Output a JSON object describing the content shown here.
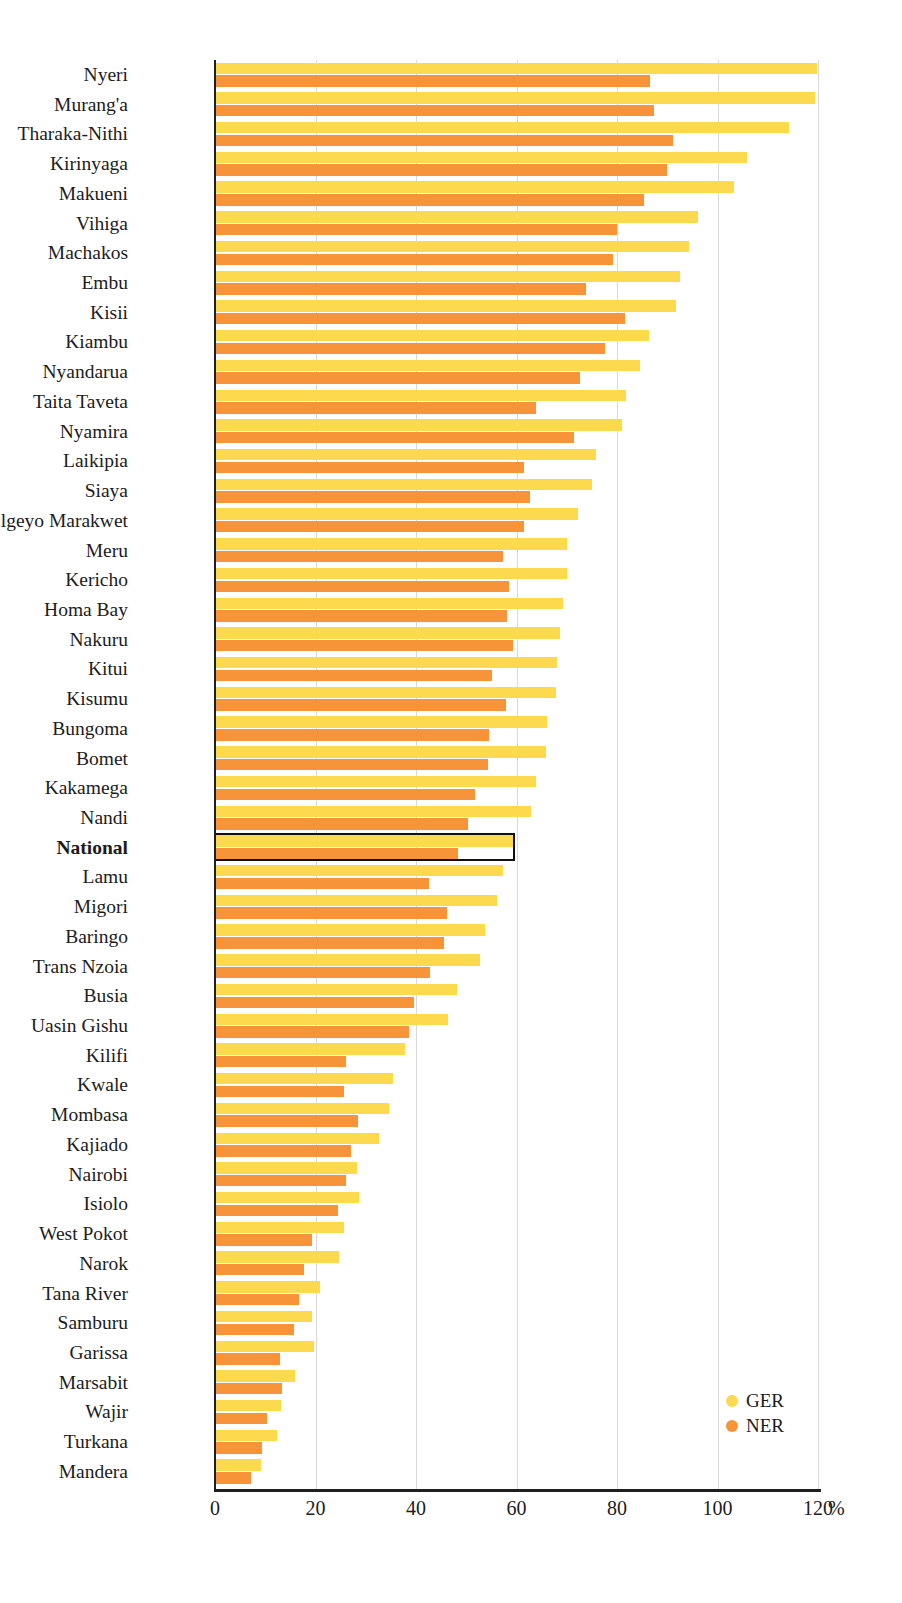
{
  "chart_data": {
    "type": "bar",
    "orientation": "horizontal",
    "title": "",
    "subtitle": "",
    "xlabel": "%",
    "ylabel": "",
    "xlim": [
      0,
      120
    ],
    "xticks": [
      0,
      20,
      40,
      60,
      80,
      100,
      120
    ],
    "xtick_labels": [
      "0",
      "20",
      "40",
      "60",
      "80",
      "100",
      "120"
    ],
    "axis_unit": "%",
    "grid": "vertical",
    "legend_position": "bottom-right",
    "highlight_category": "National",
    "colors": {
      "GER": "#fcd94d",
      "NER": "#f79338",
      "highlight_outline": "#111111",
      "gridline": "#d9d9d9",
      "axis": "#1f1f1f"
    },
    "legend": [
      {
        "name": "GER",
        "color": "#fcd94d"
      },
      {
        "name": "NER",
        "color": "#f79338"
      }
    ],
    "categories": [
      "Nyeri",
      "Murang'a",
      "Tharaka-Nithi",
      "Kirinyaga",
      "Makueni",
      "Vihiga",
      "Machakos",
      "Embu",
      "Kisii",
      "Kiambu",
      "Nyandarua",
      "Taita Taveta",
      "Nyamira",
      "Laikipia",
      "Siaya",
      "Elgeyo Marakwet",
      "Meru",
      "Kericho",
      "Homa Bay",
      "Nakuru",
      "Kitui",
      "Kisumu",
      "Bungoma",
      "Bomet",
      "Kakamega",
      "Nandi",
      "National",
      "Lamu",
      "Migori",
      "Baringo",
      "Trans Nzoia",
      "Busia",
      "Uasin Gishu",
      "Kilifi",
      "Kwale",
      "Mombasa",
      "Kajiado",
      "Nairobi",
      "Isiolo",
      "West Pokot",
      "Narok",
      "Tana River",
      "Samburu",
      "Garissa",
      "Marsabit",
      "Wajir",
      "Turkana",
      "Mandera"
    ],
    "series": [
      {
        "name": "GER",
        "values": [
          119.9,
          119.4,
          114.2,
          105.8,
          103.2,
          96.2,
          94.3,
          92.6,
          91.8,
          86.3,
          84.5,
          81.7,
          80.9,
          75.8,
          75.0,
          72.2,
          70.1,
          70.0,
          69.2,
          68.6,
          68.0,
          67.9,
          66.0,
          65.9,
          63.8,
          62.8,
          59.4,
          57.4,
          56.2,
          53.8,
          52.7,
          48.1,
          46.3,
          37.8,
          35.4,
          34.7,
          32.7,
          28.3,
          28.7,
          25.7,
          24.7,
          20.8,
          19.4,
          19.8,
          16.0,
          13.1,
          12.3,
          9.2
        ]
      },
      {
        "name": "NER",
        "values": [
          86.6,
          87.3,
          91.1,
          90.0,
          85.4,
          80.0,
          79.2,
          73.9,
          81.6,
          77.7,
          72.6,
          63.8,
          71.4,
          61.4,
          62.6,
          61.4,
          57.3,
          58.5,
          58.1,
          59.3,
          55.1,
          57.9,
          54.6,
          54.4,
          51.7,
          50.3,
          48.4,
          42.6,
          46.1,
          45.5,
          42.8,
          39.6,
          38.6,
          26.1,
          25.7,
          28.5,
          27.0,
          26.0,
          24.4,
          19.4,
          17.8,
          16.8,
          15.8,
          12.9,
          13.3,
          10.3,
          9.3,
          7.1
        ]
      }
    ]
  }
}
